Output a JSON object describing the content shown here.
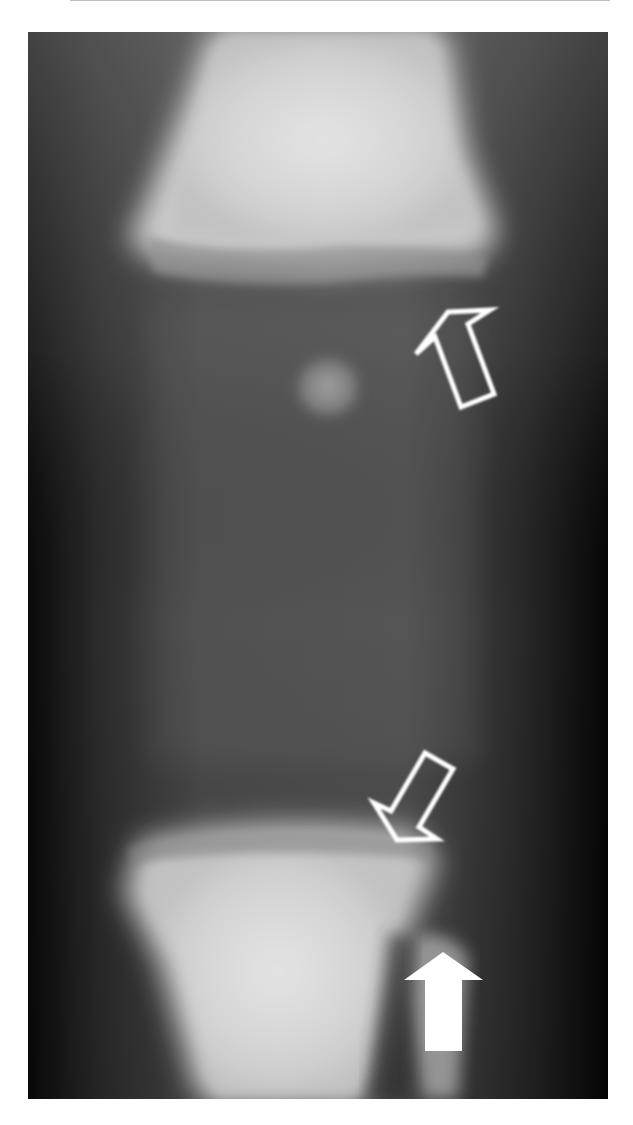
{
  "figure": {
    "type": "radiograph",
    "view": "knee AP",
    "background_color": "#ffffff",
    "image_frame": {
      "x": 28,
      "y": 32,
      "width": 580,
      "height": 1067
    }
  },
  "annotations": [
    {
      "id": "arrow-femur-physis",
      "style": "outline",
      "direction": "up-right",
      "color": "#ffffff"
    },
    {
      "id": "arrow-tibia-physis",
      "style": "outline",
      "direction": "down-left",
      "color": "#ffffff"
    },
    {
      "id": "arrow-fibula",
      "style": "solid",
      "direction": "up",
      "color": "#ffffff"
    }
  ],
  "colors": {
    "soft_tissue": "#4a4a4a",
    "bone": "#e6e6e6",
    "edge_dark": "#0d0d0d",
    "arrow": "#ffffff"
  }
}
